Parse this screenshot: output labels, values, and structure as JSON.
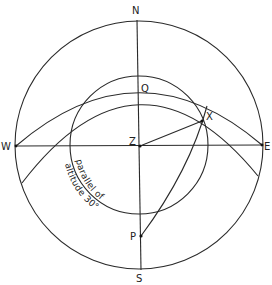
{
  "diagram": {
    "type": "celestial-sphere-projection",
    "colors": {
      "line": "#2a2a2a",
      "text": "#222222",
      "background": "#ffffff"
    },
    "labels": {
      "north": "N",
      "south": "S",
      "west": "W",
      "east": "E",
      "zenith": "Z",
      "q": "Q",
      "x": "X",
      "pole": "P"
    },
    "annotations": {
      "parallel_line1": "parallel of",
      "parallel_line2": "altitude 30°"
    },
    "elements": [
      "horizon circle",
      "meridian N-S",
      "prime vertical W-E",
      "parallel of altitude 30° circle",
      "equator arc through W, Q, E",
      "declination parallel arc",
      "hour circle arc P-X",
      "line Z-X"
    ]
  }
}
